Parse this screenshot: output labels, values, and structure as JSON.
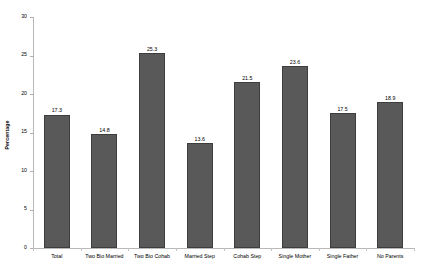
{
  "chart_data": {
    "type": "bar",
    "title": "",
    "xlabel": "",
    "ylabel": "Percentage",
    "ylim": [
      0,
      30
    ],
    "yticks": [
      0,
      5,
      10,
      15,
      20,
      25,
      30
    ],
    "ytick_labels": [
      "0",
      "5",
      "10",
      "15",
      "20",
      "25",
      "30"
    ],
    "grid": false,
    "legend": null,
    "bar_color": "#595959",
    "bar_edge_color": "#3d3d3d",
    "background_color": "#ffffff",
    "axis_color": "#b8b8b8",
    "categories": [
      "Total",
      "Two Bio Married",
      "Two Bio Cohab",
      "Married Step",
      "Cohab Step",
      "Single Mother",
      "Single Father",
      "No Parents"
    ],
    "values": [
      17.3,
      14.8,
      25.3,
      13.6,
      21.5,
      23.6,
      17.5,
      18.9
    ],
    "value_labels": [
      "17.3",
      "14.8",
      "25.3",
      "13.6",
      "21.5",
      "23.6",
      "17.5",
      "18.9"
    ]
  }
}
